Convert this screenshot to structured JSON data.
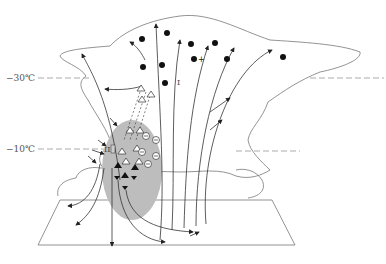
{
  "diagram": {
    "type": "thunderstorm-cloud-cross-section",
    "temperature_levels": [
      {
        "label": "−30℃",
        "y": 78
      },
      {
        "label": "−10℃",
        "y": 149
      }
    ],
    "region_labels": [
      {
        "label": "I",
        "description": "upper positive charge region"
      },
      {
        "label": "II",
        "description": "lower negative charge region"
      }
    ],
    "legend_symbols": {
      "ice_crystal_positive": "filled circle",
      "graupel_hollow": "hollow triangle",
      "graupel_filled": "filled triangle",
      "negative_charge": "circled minus",
      "positive_charge": "plus"
    },
    "colors": {
      "outline": "#777777",
      "shading": "#bdbdbd",
      "ink": "#222222"
    }
  }
}
